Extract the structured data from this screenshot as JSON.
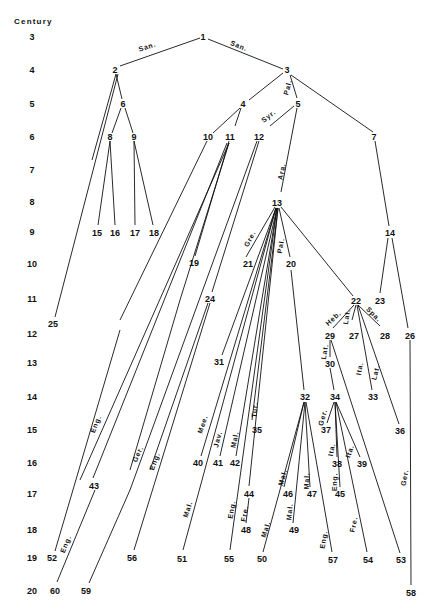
{
  "diagram": {
    "axis": {
      "title": "Century",
      "title_pos": [
        20,
        24
      ],
      "ticks": [
        {
          "label": "3",
          "y": 37
        },
        {
          "label": "4",
          "y": 70
        },
        {
          "label": "5",
          "y": 104
        },
        {
          "label": "6",
          "y": 137
        },
        {
          "label": "7",
          "y": 170
        },
        {
          "label": "8",
          "y": 202
        },
        {
          "label": "9",
          "y": 232
        },
        {
          "label": "10",
          "y": 264
        },
        {
          "label": "11",
          "y": 299
        },
        {
          "label": "12",
          "y": 334
        },
        {
          "label": "13",
          "y": 363
        },
        {
          "label": "14",
          "y": 397
        },
        {
          "label": "15",
          "y": 430
        },
        {
          "label": "16",
          "y": 463
        },
        {
          "label": "17",
          "y": 494
        },
        {
          "label": "18",
          "y": 530
        },
        {
          "label": "19",
          "y": 558
        },
        {
          "label": "20",
          "y": 591
        }
      ],
      "tick_x": 32
    },
    "nodes": [
      {
        "id": "1",
        "x": 203,
        "y": 37
      },
      {
        "id": "2",
        "x": 115,
        "y": 70
      },
      {
        "id": "3",
        "x": 287,
        "y": 70
      },
      {
        "id": "4",
        "x": 243,
        "y": 104
      },
      {
        "id": "5",
        "x": 298,
        "y": 104
      },
      {
        "id": "6",
        "x": 123,
        "y": 104
      },
      {
        "id": "7",
        "x": 374,
        "y": 137
      },
      {
        "id": "8",
        "x": 110,
        "y": 137
      },
      {
        "id": "9",
        "x": 134,
        "y": 137
      },
      {
        "id": "10",
        "x": 208,
        "y": 137
      },
      {
        "id": "11",
        "x": 230,
        "y": 137
      },
      {
        "id": "12",
        "x": 259,
        "y": 137
      },
      {
        "id": "13",
        "x": 277,
        "y": 203
      },
      {
        "id": "14",
        "x": 390,
        "y": 233
      },
      {
        "id": "15",
        "x": 97,
        "y": 233
      },
      {
        "id": "16",
        "x": 115,
        "y": 233
      },
      {
        "id": "17",
        "x": 135,
        "y": 233
      },
      {
        "id": "18",
        "x": 154,
        "y": 233
      },
      {
        "id": "19",
        "x": 194,
        "y": 263
      },
      {
        "id": "20",
        "x": 291,
        "y": 264
      },
      {
        "id": "21",
        "x": 248,
        "y": 264
      },
      {
        "id": "22",
        "x": 356,
        "y": 301
      },
      {
        "id": "23",
        "x": 380,
        "y": 301
      },
      {
        "id": "24",
        "x": 210,
        "y": 299
      },
      {
        "id": "25",
        "x": 53,
        "y": 324
      },
      {
        "id": "26",
        "x": 410,
        "y": 336
      },
      {
        "id": "27",
        "x": 354,
        "y": 336
      },
      {
        "id": "28",
        "x": 385,
        "y": 336
      },
      {
        "id": "29",
        "x": 330,
        "y": 336
      },
      {
        "id": "30",
        "x": 330,
        "y": 364
      },
      {
        "id": "31",
        "x": 219,
        "y": 362
      },
      {
        "id": "32",
        "x": 305,
        "y": 397
      },
      {
        "id": "33",
        "x": 373,
        "y": 397
      },
      {
        "id": "34",
        "x": 335,
        "y": 397
      },
      {
        "id": "35",
        "x": 257,
        "y": 430
      },
      {
        "id": "36",
        "x": 400,
        "y": 431
      },
      {
        "id": "37",
        "x": 326,
        "y": 430
      },
      {
        "id": "38",
        "x": 337,
        "y": 464
      },
      {
        "id": "39",
        "x": 362,
        "y": 464
      },
      {
        "id": "40",
        "x": 198,
        "y": 463
      },
      {
        "id": "41",
        "x": 218,
        "y": 463
      },
      {
        "id": "42",
        "x": 235,
        "y": 463
      },
      {
        "id": "43",
        "x": 94,
        "y": 486
      },
      {
        "id": "44",
        "x": 249,
        "y": 494
      },
      {
        "id": "45",
        "x": 340,
        "y": 494
      },
      {
        "id": "46",
        "x": 288,
        "y": 494
      },
      {
        "id": "47",
        "x": 312,
        "y": 494
      },
      {
        "id": "48",
        "x": 246,
        "y": 530
      },
      {
        "id": "49",
        "x": 294,
        "y": 530
      },
      {
        "id": "50",
        "x": 262,
        "y": 559
      },
      {
        "id": "51",
        "x": 182,
        "y": 559
      },
      {
        "id": "52",
        "x": 52,
        "y": 558
      },
      {
        "id": "53",
        "x": 401,
        "y": 560
      },
      {
        "id": "54",
        "x": 368,
        "y": 560
      },
      {
        "id": "55",
        "x": 229,
        "y": 559
      },
      {
        "id": "56",
        "x": 132,
        "y": 558
      },
      {
        "id": "57",
        "x": 333,
        "y": 560
      },
      {
        "id": "58",
        "x": 411,
        "y": 593
      },
      {
        "id": "59",
        "x": 86,
        "y": 591
      },
      {
        "id": "60",
        "x": 55,
        "y": 591
      }
    ],
    "edges": [
      {
        "from": [
          200,
          38
        ],
        "to": [
          120,
          66
        ],
        "label": "San.",
        "label_pos": [
          148,
          49
        ],
        "angle": -18
      },
      {
        "from": [
          208,
          39
        ],
        "to": [
          283,
          69
        ],
        "label": "San.",
        "label_pos": [
          238,
          48
        ],
        "angle": 22
      },
      {
        "from": [
          116,
          74
        ],
        "to": [
          92,
          160
        ],
        "label": ""
      },
      {
        "from": [
          116,
          74
        ],
        "to": [
          122,
          99
        ],
        "label": ""
      },
      {
        "from": [
          118,
          74
        ],
        "to": [
          55,
          317
        ],
        "label": ""
      },
      {
        "from": [
          121,
          108
        ],
        "to": [
          112,
          133
        ],
        "label": ""
      },
      {
        "from": [
          125,
          108
        ],
        "to": [
          133,
          133
        ],
        "label": ""
      },
      {
        "from": [
          110,
          141
        ],
        "to": [
          98,
          225
        ],
        "label": ""
      },
      {
        "from": [
          110,
          141
        ],
        "to": [
          115,
          225
        ],
        "label": ""
      },
      {
        "from": [
          134,
          141
        ],
        "to": [
          135,
          225
        ],
        "label": ""
      },
      {
        "from": [
          134,
          141
        ],
        "to": [
          153,
          225
        ],
        "label": ""
      },
      {
        "from": [
          283,
          73
        ],
        "to": [
          249,
          100
        ],
        "label": ""
      },
      {
        "from": [
          290,
          75
        ],
        "to": [
          297,
          98
        ],
        "label": "Pal.",
        "label_pos": [
          290,
          88
        ],
        "angle": -75
      },
      {
        "from": [
          291,
          75
        ],
        "to": [
          373,
          132
        ],
        "label": ""
      },
      {
        "from": [
          240,
          108
        ],
        "to": [
          213,
          133
        ],
        "label": ""
      },
      {
        "from": [
          241,
          108
        ],
        "to": [
          235,
          126
        ],
        "label": ""
      },
      {
        "from": [
          294,
          106
        ],
        "to": [
          270,
          126
        ],
        "label": "Syr.",
        "label_pos": [
          270,
          118
        ],
        "angle": -38
      },
      {
        "from": [
          297,
          108
        ],
        "to": [
          281,
          192
        ],
        "label": "Ara.",
        "label_pos": [
          284,
          172
        ],
        "angle": -78
      },
      {
        "from": [
          375,
          141
        ],
        "to": [
          389,
          226
        ],
        "label": ""
      },
      {
        "from": [
          207,
          141
        ],
        "to": [
          120,
          320
        ],
        "label": ""
      },
      {
        "from": [
          229,
          141
        ],
        "to": [
          195,
          256
        ],
        "label": ""
      },
      {
        "from": [
          227,
          143
        ],
        "to": [
          93,
          478
        ],
        "label": ""
      },
      {
        "from": [
          229,
          143
        ],
        "to": [
          80,
          480
        ],
        "label": ""
      },
      {
        "from": [
          257,
          141
        ],
        "to": [
          130,
          490
        ],
        "label": ""
      },
      {
        "from": [
          259,
          141
        ],
        "to": [
          212,
          292
        ],
        "label": ""
      },
      {
        "from": [
          208,
          303
        ],
        "to": [
          150,
          470
        ],
        "label": ""
      },
      {
        "from": [
          95,
          490
        ],
        "to": [
          57,
          582
        ],
        "label": "Eng.",
        "label_pos": [
          68,
          545
        ],
        "angle": -68
      },
      {
        "from": [
          120,
          330
        ],
        "to": [
          55,
          551
        ],
        "label": "Eng.",
        "label_pos": [
          98,
          425
        ],
        "angle": -68
      },
      {
        "from": [
          130,
          490
        ],
        "to": [
          89,
          583
        ],
        "label": ""
      },
      {
        "from": [
          210,
          303
        ],
        "to": [
          134,
          550
        ],
        "label": "Eng.",
        "label_pos": [
          157,
          462
        ],
        "angle": -70
      },
      {
        "from": [
          229,
          143
        ],
        "to": [
          180,
          300
        ],
        "label": ""
      },
      {
        "from": [
          180,
          300
        ],
        "to": [
          130,
          470
        ],
        "label": "Ger.",
        "label_pos": [
          140,
          455
        ],
        "angle": -65
      },
      {
        "from": [
          388,
          238
        ],
        "to": [
          380,
          293
        ],
        "label": ""
      },
      {
        "from": [
          392,
          238
        ],
        "to": [
          408,
          328
        ],
        "label": ""
      },
      {
        "from": [
          275,
          207
        ],
        "to": [
          246,
          257
        ],
        "label": "Gre.",
        "label_pos": [
          252,
          240
        ],
        "angle": -62
      },
      {
        "from": [
          279,
          208
        ],
        "to": [
          290,
          257
        ],
        "label": "Pal.",
        "label_pos": [
          283,
          246
        ],
        "angle": -80
      },
      {
        "from": [
          281,
          207
        ],
        "to": [
          353,
          296
        ],
        "label": ""
      },
      {
        "from": [
          276,
          208
        ],
        "to": [
          222,
          355
        ],
        "label": ""
      },
      {
        "from": [
          276,
          208
        ],
        "to": [
          201,
          456
        ],
        "label": "Mee.",
        "label_pos": [
          205,
          425
        ],
        "angle": -72
      },
      {
        "from": [
          277,
          208
        ],
        "to": [
          220,
          456
        ],
        "label": "Jav.",
        "label_pos": [
          220,
          440
        ],
        "angle": -75
      },
      {
        "from": [
          277,
          208
        ],
        "to": [
          236,
          456
        ],
        "label": "Mal.",
        "label_pos": [
          237,
          440
        ],
        "angle": -78
      },
      {
        "from": [
          278,
          208
        ],
        "to": [
          252,
          420
        ],
        "label": "Tur.",
        "label_pos": [
          257,
          410
        ],
        "angle": -85
      },
      {
        "from": [
          278,
          208
        ],
        "to": [
          249,
          486
        ],
        "label": ""
      },
      {
        "from": [
          276,
          208
        ],
        "to": [
          183,
          550
        ],
        "label": "Mal.",
        "label_pos": [
          190,
          510
        ],
        "angle": -72
      },
      {
        "from": [
          277,
          208
        ],
        "to": [
          230,
          550
        ],
        "label": "Eng.",
        "label_pos": [
          234,
          510
        ],
        "angle": -80
      },
      {
        "from": [
          291,
          270
        ],
        "to": [
          304,
          390
        ],
        "label": ""
      },
      {
        "from": [
          354,
          305
        ],
        "to": [
          333,
          328
        ],
        "label": "Heb.",
        "label_pos": [
          335,
          320
        ],
        "angle": -42
      },
      {
        "from": [
          356,
          305
        ],
        "to": [
          352,
          320
        ],
        "label": "Lat.",
        "label_pos": [
          349,
          317
        ],
        "angle": -80
      },
      {
        "from": [
          358,
          305
        ],
        "to": [
          380,
          326
        ],
        "label": "Spa.",
        "label_pos": [
          372,
          316
        ],
        "angle": 45
      },
      {
        "from": [
          357,
          305
        ],
        "to": [
          372,
          390
        ],
        "label": "Ita.",
        "label_pos": [
          362,
          369
        ],
        "angle": -80
      },
      {
        "from": [
          358,
          305
        ],
        "to": [
          399,
          424
        ],
        "label": "Lat.",
        "label_pos": [
          378,
          373
        ],
        "angle": -75
      },
      {
        "from": [
          330,
          340
        ],
        "to": [
          330,
          357
        ],
        "label": "Lat.",
        "label_pos": [
          327,
          352
        ],
        "angle": -80
      },
      {
        "from": [
          331,
          340
        ],
        "to": [
          400,
          553
        ],
        "label": ""
      },
      {
        "from": [
          330,
          368
        ],
        "to": [
          334,
          390
        ],
        "label": ""
      },
      {
        "from": [
          410,
          340
        ],
        "to": [
          411,
          585
        ],
        "label": "Ger.",
        "label_pos": [
          407,
          478
        ],
        "angle": -80
      },
      {
        "from": [
          334,
          402
        ],
        "to": [
          327,
          423
        ],
        "label": "Ger.",
        "label_pos": [
          325,
          418
        ],
        "angle": -75
      },
      {
        "from": [
          335,
          402
        ],
        "to": [
          337,
          457
        ],
        "label": "Ita.",
        "label_pos": [
          334,
          450
        ],
        "angle": -80
      },
      {
        "from": [
          336,
          402
        ],
        "to": [
          360,
          457
        ],
        "label": "Ita.",
        "label_pos": [
          352,
          452
        ],
        "angle": -70
      },
      {
        "from": [
          335,
          402
        ],
        "to": [
          340,
          487
        ],
        "label": "Eng.",
        "label_pos": [
          337,
          482
        ],
        "angle": -88
      },
      {
        "from": [
          336,
          402
        ],
        "to": [
          367,
          552
        ],
        "label": "Fre.",
        "label_pos": [
          356,
          525
        ],
        "angle": -78
      },
      {
        "from": [
          304,
          402
        ],
        "to": [
          263,
          552
        ],
        "label": "Mal.",
        "label_pos": [
          268,
          530
        ],
        "angle": -72
      },
      {
        "from": [
          304,
          402
        ],
        "to": [
          284,
          487
        ],
        "label": "Mal.",
        "label_pos": [
          285,
          478
        ],
        "angle": -75
      },
      {
        "from": [
          305,
          402
        ],
        "to": [
          293,
          523
        ],
        "label": "Mal.",
        "label_pos": [
          292,
          512
        ],
        "angle": -85
      },
      {
        "from": [
          305,
          402
        ],
        "to": [
          310,
          487
        ],
        "label": "Mal.",
        "label_pos": [
          309,
          481
        ],
        "angle": -88
      },
      {
        "from": [
          306,
          402
        ],
        "to": [
          332,
          552
        ],
        "label": "Eng.",
        "label_pos": [
          326,
          540
        ],
        "angle": -80
      },
      {
        "from": [
          249,
          498
        ],
        "to": [
          246,
          523
        ],
        "label": "Fre.",
        "label_pos": [
          247,
          514
        ],
        "angle": -80
      }
    ]
  }
}
